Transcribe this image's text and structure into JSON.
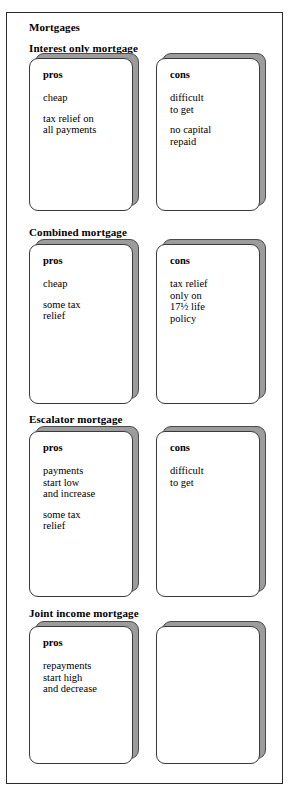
{
  "diagram": {
    "title": "Mortgages",
    "sections": [
      {
        "heading": "Interest only mortgage",
        "pros": {
          "label": "pros",
          "points": [
            "cheap",
            "tax relief on\nall payments"
          ]
        },
        "cons": {
          "label": "cons",
          "points": [
            "difficult\nto get",
            "no capital\nrepaid"
          ]
        }
      },
      {
        "heading": "Combined mortgage",
        "pros": {
          "label": "pros",
          "points": [
            "cheap",
            "some tax\nrelief"
          ]
        },
        "cons": {
          "label": "cons",
          "points": [
            "tax relief\nonly on\n17½ life\npolicy"
          ]
        }
      },
      {
        "heading": "Escalator mortgage",
        "pros": {
          "label": "pros",
          "points": [
            "payments\nstart low\nand increase",
            "some tax\nrelief"
          ]
        },
        "cons": {
          "label": "cons",
          "points": [
            "difficult\nto get"
          ]
        }
      },
      {
        "heading": "Joint income mortgage",
        "pros": {
          "label": "pros",
          "points": [
            "repayments\nstart high\nand decrease"
          ]
        },
        "cons": {
          "label": "",
          "points": []
        }
      }
    ],
    "colors": {
      "frame_border": "#2b2b2b",
      "card_border": "#3a3a3a",
      "card_face": "#ffffff",
      "card_shadow": "#9c9c9c",
      "text": "#000000"
    }
  }
}
